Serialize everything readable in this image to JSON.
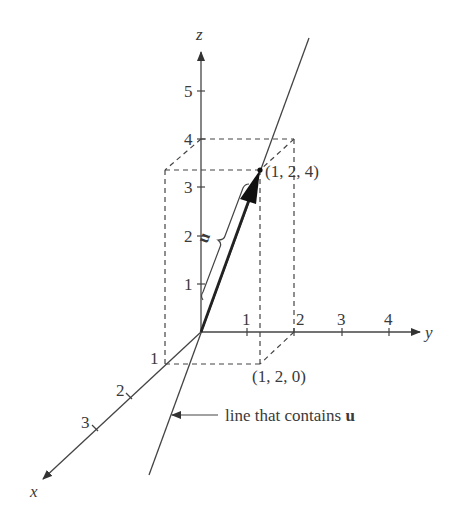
{
  "diagram": {
    "type": "3d-vector-diagram",
    "axes": {
      "x": {
        "label": "x",
        "ticks": [
          "1",
          "2",
          "3"
        ]
      },
      "y": {
        "label": "y",
        "ticks": [
          "1",
          "2",
          "3",
          "4"
        ]
      },
      "z": {
        "label": "z",
        "ticks": [
          "1",
          "2",
          "3",
          "4",
          "5"
        ]
      }
    },
    "vector": {
      "label": "u",
      "from": [
        0,
        0,
        0
      ],
      "to": [
        1,
        2,
        4
      ]
    },
    "points": {
      "tip": "(1, 2, 4)",
      "base": "(1, 2, 0)"
    },
    "annotation": {
      "text": "line that contains ",
      "bold": "u"
    }
  }
}
